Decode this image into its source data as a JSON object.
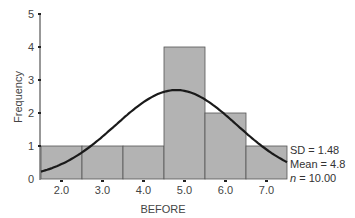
{
  "chart_data": {
    "type": "bar",
    "subtype": "histogram_with_normal_curve",
    "title": "",
    "xlabel": "BEFORE",
    "ylabel": "Frequency",
    "x_ticks": [
      "2.0",
      "3.0",
      "4.0",
      "5.0",
      "6.0",
      "7.0"
    ],
    "y_ticks": [
      "0",
      "1",
      "2",
      "3",
      "4",
      "5"
    ],
    "ylim": [
      0,
      5
    ],
    "xlim": [
      1.5,
      7.5
    ],
    "bins": [
      {
        "from": 1.5,
        "to": 2.5,
        "center": 2.0,
        "count": 1
      },
      {
        "from": 2.5,
        "to": 3.5,
        "center": 3.0,
        "count": 1
      },
      {
        "from": 3.5,
        "to": 4.5,
        "center": 4.0,
        "count": 1
      },
      {
        "from": 4.5,
        "to": 5.5,
        "center": 5.0,
        "count": 4
      },
      {
        "from": 5.5,
        "to": 6.5,
        "center": 6.0,
        "count": 2
      },
      {
        "from": 6.5,
        "to": 7.5,
        "center": 7.0,
        "count": 1
      }
    ],
    "categories": [
      "2.0",
      "3.0",
      "4.0",
      "5.0",
      "6.0",
      "7.0"
    ],
    "values": [
      1,
      1,
      1,
      4,
      2,
      1
    ],
    "normal_curve": {
      "mean": 4.8,
      "sd": 1.48,
      "n": 10
    },
    "grid": false,
    "bar_color": "#b3b3b3",
    "curve_color": "#1a1a1a"
  },
  "stats": {
    "sd_label": "SD = 1.48",
    "mean_label": "Mean = 4.8",
    "n_var": "n",
    "n_value": " = 10.00"
  }
}
